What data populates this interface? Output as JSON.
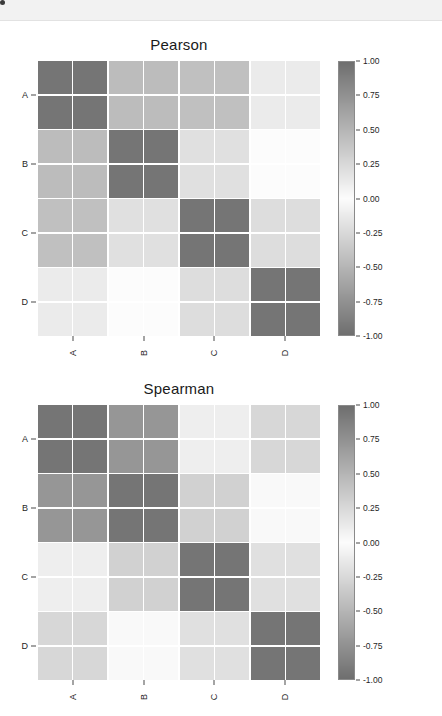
{
  "window": {
    "banner_dot": "window-dot"
  },
  "chart_data": [
    {
      "type": "heatmap",
      "title": "Pearson",
      "xlabel": "",
      "ylabel": "",
      "group_labels": [
        "A",
        "B",
        "C",
        "D"
      ],
      "x_tick_labels": [
        "A",
        "B",
        "C",
        "D"
      ],
      "y_tick_labels": [
        "A",
        "B",
        "C",
        "D"
      ],
      "colorbar": {
        "ticks": [
          1.0,
          0.75,
          0.5,
          0.25,
          0.0,
          -0.25,
          -0.5,
          -0.75,
          -1.0
        ],
        "tick_labels": [
          "1.00",
          "0.75",
          "0.50",
          "0.25",
          "0.00",
          "-0.25",
          "-0.50",
          "-0.75",
          "-1.00"
        ],
        "vmin": -1.0,
        "vmax": 1.0,
        "cmap": "diverging-gray",
        "position": "right"
      },
      "rows": 8,
      "cols": 8,
      "values": [
        [
          0.95,
          0.95,
          0.45,
          0.45,
          0.42,
          0.42,
          0.12,
          0.12
        ],
        [
          0.95,
          0.95,
          0.45,
          0.45,
          0.42,
          0.42,
          0.12,
          0.12
        ],
        [
          0.45,
          0.45,
          0.95,
          0.95,
          0.2,
          0.2,
          0.0,
          0.0
        ],
        [
          0.45,
          0.45,
          0.95,
          0.95,
          0.2,
          0.2,
          0.0,
          0.0
        ],
        [
          0.42,
          0.42,
          0.2,
          0.2,
          0.95,
          0.95,
          0.22,
          0.22
        ],
        [
          0.42,
          0.42,
          0.2,
          0.2,
          0.95,
          0.95,
          0.22,
          0.22
        ],
        [
          0.12,
          0.12,
          0.0,
          0.0,
          0.22,
          0.22,
          0.95,
          0.95
        ],
        [
          0.12,
          0.12,
          0.0,
          0.0,
          0.22,
          0.22,
          0.95,
          0.95
        ]
      ]
    },
    {
      "type": "heatmap",
      "title": "Spearman",
      "xlabel": "",
      "ylabel": "",
      "group_labels": [
        "A",
        "B",
        "C",
        "D"
      ],
      "x_tick_labels": [
        "A",
        "B",
        "C",
        "D"
      ],
      "y_tick_labels": [
        "A",
        "B",
        "C",
        "D"
      ],
      "colorbar": {
        "ticks": [
          1.0,
          0.75,
          0.5,
          0.25,
          0.0,
          -0.25,
          -0.5,
          -0.75,
          -1.0
        ],
        "tick_labels": [
          "1.00",
          "0.75",
          "0.50",
          "0.25",
          "0.00",
          "-0.25",
          "-0.50",
          "-0.75",
          "-1.00"
        ],
        "vmin": -1.0,
        "vmax": 1.0,
        "cmap": "diverging-gray",
        "position": "right"
      },
      "rows": 8,
      "cols": 8,
      "values": [
        [
          0.95,
          0.95,
          0.72,
          0.72,
          0.1,
          0.1,
          0.26,
          0.26
        ],
        [
          0.95,
          0.95,
          0.72,
          0.72,
          0.1,
          0.1,
          0.26,
          0.26
        ],
        [
          0.72,
          0.72,
          0.95,
          0.95,
          0.3,
          0.3,
          0.02,
          0.02
        ],
        [
          0.72,
          0.72,
          0.95,
          0.95,
          0.3,
          0.3,
          0.02,
          0.02
        ],
        [
          0.1,
          0.1,
          0.3,
          0.3,
          0.95,
          0.95,
          0.2,
          0.2
        ],
        [
          0.1,
          0.1,
          0.3,
          0.3,
          0.95,
          0.95,
          0.2,
          0.2
        ],
        [
          0.26,
          0.26,
          0.02,
          0.02,
          0.2,
          0.2,
          0.95,
          0.95
        ],
        [
          0.26,
          0.26,
          0.02,
          0.02,
          0.2,
          0.2,
          0.95,
          0.95
        ]
      ]
    }
  ]
}
